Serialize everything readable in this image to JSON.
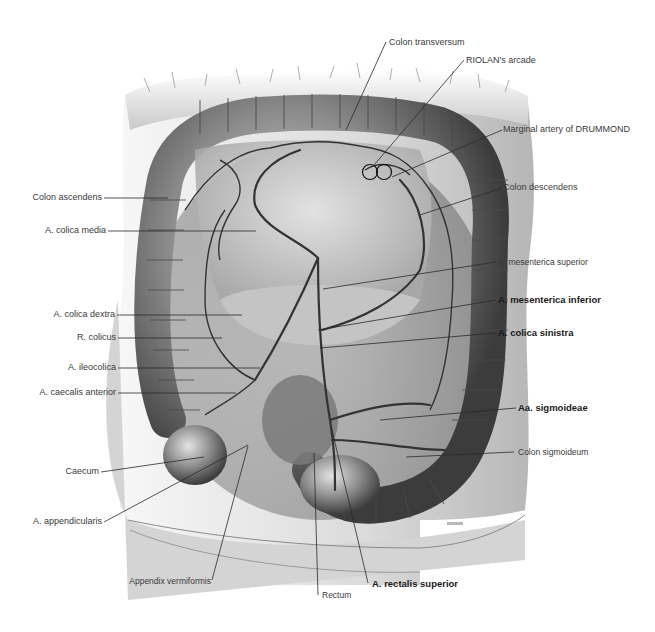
{
  "figure": {
    "colors": {
      "background": "#ffffff",
      "leader_line": "#2a2a2a",
      "text": "#3a3a3a",
      "bold_text": "#1a1a1a",
      "tissue_dark": "#4a4a4a",
      "tissue_light": "#d8d8d8"
    }
  },
  "labels": {
    "left": [
      {
        "text": "Colon ascendens",
        "bold": false
      },
      {
        "text": "A. colica media",
        "bold": false
      },
      {
        "text": "A. colica dextra",
        "bold": false
      },
      {
        "text": "R. colicus",
        "bold": false
      },
      {
        "text": "A. ileocolica",
        "bold": false
      },
      {
        "text": "A. caecalis anterior",
        "bold": false
      },
      {
        "text": "Caecum",
        "bold": false
      },
      {
        "text": "A. appendicularis",
        "bold": false
      }
    ],
    "top": [
      {
        "text": "Colon transversum",
        "bold": false
      },
      {
        "text": "RIOLAN's arcade",
        "bold": false
      }
    ],
    "right": [
      {
        "text": "Marginal artery of DRUMMOND",
        "bold": false
      },
      {
        "text": "Colon descendens",
        "bold": false
      },
      {
        "text": "A. mesenterica superior",
        "bold": false
      },
      {
        "text": "A. mesenterica inferior",
        "bold": true
      },
      {
        "text": "A. colica sinistra",
        "bold": true
      },
      {
        "text": "Aa. sigmoideae",
        "bold": true
      },
      {
        "text": "Colon sigmoideum",
        "bold": false
      }
    ],
    "bottom": [
      {
        "text": "Appendix vermiformis",
        "bold": false
      },
      {
        "text": "Rectum",
        "bold": false
      },
      {
        "text": "A. rectalis superior",
        "bold": true
      }
    ]
  }
}
